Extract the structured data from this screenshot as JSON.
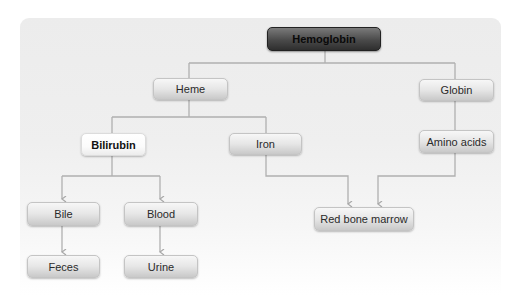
{
  "diagram": {
    "colors": {
      "panel": "#ececec",
      "line": "#a8a8a8",
      "node_light": "#e6e6e6",
      "node_root": "#4a4a4a"
    },
    "nodes": {
      "hemoglobin": "Hemoglobin",
      "heme": "Heme",
      "globin": "Globin",
      "bilirubin": "Bilirubin",
      "iron": "Iron",
      "amino_acids": "Amino acids",
      "bile": "Bile",
      "blood": "Blood",
      "red_bone_marrow": "Red bone marrow",
      "feces": "Feces",
      "urine": "Urine"
    },
    "edges": [
      {
        "from": "Hemoglobin",
        "to": "Heme"
      },
      {
        "from": "Hemoglobin",
        "to": "Globin"
      },
      {
        "from": "Heme",
        "to": "Bilirubin"
      },
      {
        "from": "Heme",
        "to": "Iron"
      },
      {
        "from": "Globin",
        "to": "Amino acids"
      },
      {
        "from": "Bilirubin",
        "to": "Bile",
        "arrow": true
      },
      {
        "from": "Bilirubin",
        "to": "Blood",
        "arrow": true
      },
      {
        "from": "Iron",
        "to": "Red bone marrow",
        "arrow": true
      },
      {
        "from": "Amino acids",
        "to": "Red bone marrow",
        "arrow": true
      },
      {
        "from": "Bile",
        "to": "Feces",
        "arrow": true
      },
      {
        "from": "Blood",
        "to": "Urine",
        "arrow": true
      }
    ]
  }
}
